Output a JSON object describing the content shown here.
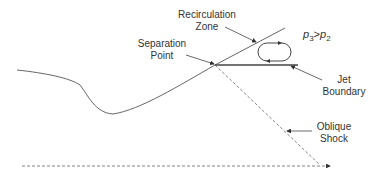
{
  "diagram": {
    "labels": {
      "recirculation_zone": [
        "Recirculation",
        "Zone"
      ],
      "separation_point": [
        "Separation",
        "Point"
      ],
      "pressure_relation": {
        "lhs": "p",
        "lhs_sub": "3",
        "op": ">",
        "rhs": "p",
        "rhs_sub": "2"
      },
      "jet_boundary": [
        "Jet",
        "Boundary"
      ],
      "oblique_shock": [
        "Oblique",
        "Shock"
      ]
    },
    "colors": {
      "line": "#555555",
      "text": "#333333",
      "background": "#ffffff"
    }
  }
}
